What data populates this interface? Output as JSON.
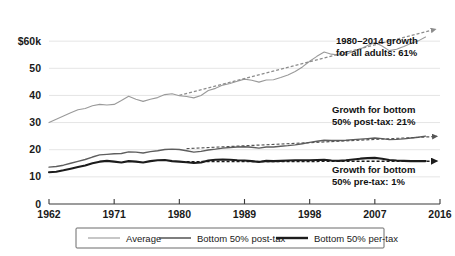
{
  "chart_data": {
    "type": "line",
    "title": "",
    "subtitle": "",
    "xlabel": "",
    "ylabel": "",
    "xlim": [
      1962,
      2016
    ],
    "ylim": [
      0,
      70
    ],
    "grid": true,
    "legend_position": "bottom",
    "y_ticks": [
      {
        "value": 0,
        "label": "0"
      },
      {
        "value": 10,
        "label": "10"
      },
      {
        "value": 20,
        "label": "20"
      },
      {
        "value": 30,
        "label": "30"
      },
      {
        "value": 40,
        "label": "40"
      },
      {
        "value": 50,
        "label": "50"
      },
      {
        "value": 60,
        "label": "$60k"
      }
    ],
    "x_ticks": [
      {
        "value": 1962,
        "label": "1962"
      },
      {
        "value": 1971,
        "label": "1971"
      },
      {
        "value": 1980,
        "label": "1980"
      },
      {
        "value": 1989,
        "label": "1989"
      },
      {
        "value": 1998,
        "label": "1998"
      },
      {
        "value": 2007,
        "label": "2007"
      },
      {
        "value": 2016,
        "label": "2016"
      }
    ],
    "x": [
      1962,
      1963,
      1964,
      1965,
      1966,
      1967,
      1968,
      1969,
      1970,
      1971,
      1972,
      1973,
      1974,
      1975,
      1976,
      1977,
      1978,
      1979,
      1980,
      1981,
      1982,
      1983,
      1984,
      1985,
      1986,
      1987,
      1988,
      1989,
      1990,
      1991,
      1992,
      1993,
      1994,
      1995,
      1996,
      1997,
      1998,
      1999,
      2000,
      2001,
      2002,
      2003,
      2004,
      2005,
      2006,
      2007,
      2008,
      2009,
      2010,
      2011,
      2012,
      2013,
      2014
    ],
    "series": [
      {
        "name": "Average",
        "color": "#9a9a9a",
        "width": 1.1,
        "values": [
          30.0,
          31.2,
          32.4,
          33.6,
          34.7,
          35.2,
          36.2,
          36.7,
          36.5,
          36.7,
          38.1,
          39.7,
          38.6,
          37.8,
          38.6,
          39.2,
          40.3,
          40.6,
          39.9,
          39.6,
          39.1,
          40.0,
          41.8,
          42.6,
          43.8,
          44.4,
          45.2,
          46.0,
          45.6,
          44.9,
          45.7,
          45.8,
          46.6,
          47.5,
          48.8,
          50.5,
          52.6,
          54.4,
          56.0,
          55.2,
          54.9,
          55.1,
          56.2,
          57.1,
          58.4,
          59.5,
          58.2,
          56.5,
          57.0,
          58.0,
          59.2,
          60.1,
          61.5
        ]
      },
      {
        "name": "Bottom 50% post-tax",
        "color": "#5e5e5e",
        "width": 1.4,
        "values": [
          13.6,
          13.8,
          14.3,
          15.0,
          15.7,
          16.4,
          17.3,
          18.1,
          18.3,
          18.5,
          18.6,
          19.2,
          19.1,
          18.8,
          19.3,
          19.6,
          20.1,
          20.2,
          20.1,
          19.6,
          19.1,
          19.4,
          19.9,
          20.2,
          20.6,
          20.8,
          21.0,
          21.1,
          20.9,
          20.6,
          21.0,
          21.0,
          21.3,
          21.5,
          21.8,
          22.2,
          22.7,
          23.1,
          23.5,
          23.4,
          23.4,
          23.5,
          23.7,
          23.9,
          24.1,
          24.3,
          24.1,
          23.7,
          23.8,
          24.0,
          24.3,
          24.6,
          25.0
        ]
      },
      {
        "name": "Bottom 50% per-tax",
        "color": "#1c1c1c",
        "width": 2.1,
        "values": [
          11.7,
          11.9,
          12.4,
          13.0,
          13.6,
          14.2,
          15.0,
          15.6,
          15.9,
          15.6,
          15.3,
          15.8,
          15.6,
          15.3,
          15.8,
          16.1,
          16.2,
          15.8,
          15.6,
          15.4,
          15.1,
          15.3,
          16.0,
          16.3,
          16.4,
          16.3,
          16.1,
          16.0,
          15.8,
          15.5,
          15.9,
          15.8,
          15.9,
          16.0,
          16.1,
          16.1,
          16.1,
          16.2,
          16.3,
          16.0,
          15.9,
          16.1,
          16.4,
          16.7,
          16.9,
          17.0,
          16.7,
          16.2,
          16.0,
          15.9,
          15.8,
          15.8,
          15.8
        ]
      }
    ],
    "trend_lines": [
      {
        "name": "average-trend",
        "color": "#8c8c8c",
        "start": {
          "x": 1980,
          "y": 40.0
        },
        "end": {
          "x": 2015.4,
          "y": 64.4
        },
        "dashed": true,
        "arrow": true
      },
      {
        "name": "bottom-post-tax-trend",
        "color": "#555555",
        "start": {
          "x": 1981,
          "y": 20.4
        },
        "end": {
          "x": 2015.6,
          "y": 24.9
        },
        "dashed": true,
        "arrow": true
      },
      {
        "name": "bottom-pre-tax-trend",
        "color": "#1c1c1c",
        "start": {
          "x": 1981,
          "y": 15.6
        },
        "end": {
          "x": 2015.6,
          "y": 15.8
        },
        "dashed": true,
        "arrow": true
      }
    ],
    "annotations": [
      {
        "name": "annotation-all-adults",
        "line1": "1980–2014 growth",
        "line2": "for all adults: 61%",
        "x": 336,
        "y": 44
      },
      {
        "name": "annotation-bottom-post-tax",
        "line1": "Growth for bottom",
        "line2": "50% post-tax: 21%",
        "x": 332,
        "y": 113
      },
      {
        "name": "annotation-bottom-pre-tax",
        "line1": "Growth for bottom",
        "line2": "50% pre-tax: 1%",
        "x": 332,
        "y": 173
      }
    ],
    "legend": [
      {
        "label": "Average",
        "color": "#9a9a9a",
        "width": 1.1
      },
      {
        "label": "Bottom 50% post-tax",
        "color": "#5e5e5e",
        "width": 1.6
      },
      {
        "label": "Bottom 50% per-tax",
        "color": "#1c1c1c",
        "width": 2.4
      }
    ],
    "colors": {
      "background": "#ffffff",
      "gridline": "#d8d8d8",
      "axis": "#3a3a3a",
      "text": "#1a1a1a"
    }
  }
}
